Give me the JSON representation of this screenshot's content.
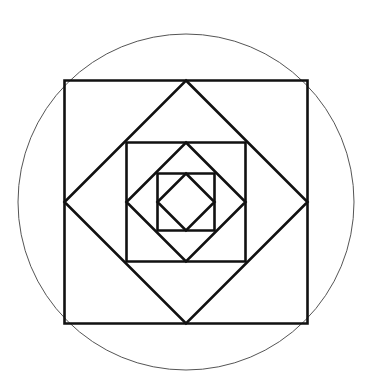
{
  "diagram": {
    "center": [
      186,
      202
    ],
    "circle": {
      "radius": 168,
      "stroke": "#555555",
      "stroke_width": 1
    },
    "stroke_color": "#111111",
    "shapes": [
      {
        "kind": "square",
        "half": 121.5
      },
      {
        "kind": "diamond",
        "half": 121.5
      },
      {
        "kind": "square",
        "half": 59.5
      },
      {
        "kind": "diamond",
        "half": 59.5
      },
      {
        "kind": "square",
        "half": 28.5
      },
      {
        "kind": "diamond",
        "half": 28.5
      }
    ]
  }
}
